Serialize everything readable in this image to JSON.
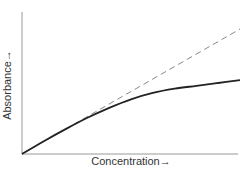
{
  "chart_data": {
    "type": "line",
    "title": "",
    "xlabel": "Concentration→",
    "ylabel": "Absorbance→",
    "grid": false,
    "legend": null,
    "xlim": [
      0,
      1
    ],
    "ylim": [
      0,
      1
    ],
    "series": [
      {
        "name": "Ideal (Beer-Lambert linear)",
        "style": "dashed",
        "color": "#777777",
        "x": [
          0,
          1
        ],
        "y": [
          0,
          0.88
        ]
      },
      {
        "name": "Observed (negative deviation)",
        "style": "solid",
        "color": "#222222",
        "x": [
          0,
          0.1,
          0.2,
          0.3,
          0.4,
          0.5,
          0.6,
          0.7,
          0.8,
          0.9,
          1.0
        ],
        "y": [
          0,
          0.09,
          0.175,
          0.255,
          0.325,
          0.385,
          0.43,
          0.46,
          0.48,
          0.5,
          0.52
        ]
      }
    ]
  }
}
